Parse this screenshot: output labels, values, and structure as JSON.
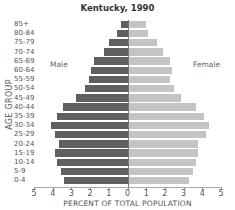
{
  "chart_data": {
    "type": "bar",
    "subtype": "population-pyramid",
    "title": "Kentucky, 1990",
    "xlabel": "PERCENT OF TOTAL POPULATION",
    "ylabel": "AGE GROUP",
    "xlim": [
      -5,
      5
    ],
    "x_ticks": [
      "5",
      "4",
      "3",
      "2",
      "1",
      "0",
      "1",
      "2",
      "3",
      "4",
      "5"
    ],
    "grid": false,
    "legend": [
      "Male",
      "Female"
    ],
    "categories": [
      "85+",
      "80-84",
      "75-79",
      "70-74",
      "65-69",
      "60-64",
      "55-59",
      "50-54",
      "45-49",
      "40-44",
      "35-39",
      "30-34",
      "25-29",
      "20-24",
      "15-19",
      "10-14",
      "5-9",
      "0-4"
    ],
    "series": [
      {
        "name": "Male",
        "color": "#5f5f5f",
        "values": [
          0.4,
          0.6,
          1.0,
          1.3,
          1.8,
          2.0,
          2.1,
          2.3,
          2.8,
          3.5,
          3.8,
          4.1,
          3.9,
          3.7,
          3.9,
          3.8,
          3.6,
          3.4
        ]
      },
      {
        "name": "Female",
        "color": "#c4c4c4",
        "values": [
          0.9,
          1.0,
          1.5,
          1.8,
          2.2,
          2.3,
          2.2,
          2.4,
          2.8,
          3.6,
          4.0,
          4.3,
          4.1,
          3.7,
          3.7,
          3.6,
          3.4,
          3.2
        ]
      }
    ]
  },
  "labels": {
    "title": "Kentucky, 1990",
    "ylabel": "AGE GROUP",
    "xlabel": "PERCENT OF TOTAL POPULATION",
    "male": "Male",
    "female": "Female"
  }
}
